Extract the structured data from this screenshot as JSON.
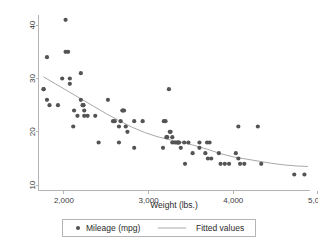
{
  "chart_data": {
    "type": "scatter",
    "title": "",
    "xlabel": "Weight (lbs.)",
    "ylabel": "",
    "xlim": [
      1700,
      4900
    ],
    "ylim": [
      9,
      42
    ],
    "grid": false,
    "legend_position": "bottom",
    "xticks": [
      2000,
      3000,
      4000,
      5000
    ],
    "xtick_labels": [
      "2,000",
      "3,000",
      "4,000",
      "5,000"
    ],
    "yticks": [
      10,
      20,
      30,
      40
    ],
    "ytick_labels": [
      "10",
      "20",
      "30",
      "40"
    ],
    "marker_color": "#545454",
    "line_color": "#a8a8a8",
    "axis_color": "#b4b4b4",
    "series": [
      {
        "name": "Mileage (mpg)",
        "type": "scatter",
        "marker": "filled-circle",
        "points": [
          [
            1760,
            28
          ],
          [
            1760,
            28
          ],
          [
            1800,
            34
          ],
          [
            1800,
            26
          ],
          [
            1830,
            25
          ],
          [
            1930,
            25
          ],
          [
            1980,
            30
          ],
          [
            2020,
            41
          ],
          [
            2020,
            35
          ],
          [
            2050,
            35
          ],
          [
            2070,
            29
          ],
          [
            2070,
            30
          ],
          [
            2110,
            21
          ],
          [
            2120,
            24
          ],
          [
            2160,
            23
          ],
          [
            2200,
            31
          ],
          [
            2200,
            26
          ],
          [
            2220,
            25
          ],
          [
            2230,
            25
          ],
          [
            2230,
            25
          ],
          [
            2240,
            24
          ],
          [
            2240,
            23
          ],
          [
            2280,
            23
          ],
          [
            2370,
            23
          ],
          [
            2410,
            18
          ],
          [
            2520,
            26
          ],
          [
            2580,
            22
          ],
          [
            2600,
            22
          ],
          [
            2650,
            18
          ],
          [
            2650,
            21
          ],
          [
            2670,
            22
          ],
          [
            2690,
            24
          ],
          [
            2700,
            24
          ],
          [
            2710,
            24
          ],
          [
            2730,
            21
          ],
          [
            2750,
            20
          ],
          [
            2830,
            17
          ],
          [
            2830,
            22
          ],
          [
            2930,
            22
          ],
          [
            3170,
            17
          ],
          [
            3180,
            22
          ],
          [
            3200,
            22
          ],
          [
            3210,
            19
          ],
          [
            3220,
            19
          ],
          [
            3240,
            28
          ],
          [
            3250,
            20
          ],
          [
            3260,
            20
          ],
          [
            3280,
            19
          ],
          [
            3280,
            18
          ],
          [
            3310,
            18
          ],
          [
            3330,
            18
          ],
          [
            3350,
            18
          ],
          [
            3350,
            18
          ],
          [
            3360,
            18
          ],
          [
            3380,
            17
          ],
          [
            3420,
            18
          ],
          [
            3430,
            14
          ],
          [
            3470,
            18
          ],
          [
            3520,
            16
          ],
          [
            3600,
            18
          ],
          [
            3600,
            17
          ],
          [
            3670,
            16
          ],
          [
            3690,
            18
          ],
          [
            3700,
            15
          ],
          [
            3720,
            18
          ],
          [
            3740,
            15
          ],
          [
            3830,
            16
          ],
          [
            3850,
            14
          ],
          [
            3900,
            14
          ],
          [
            3950,
            14
          ],
          [
            4030,
            16
          ],
          [
            4060,
            21
          ],
          [
            4060,
            15
          ],
          [
            4080,
            14
          ],
          [
            4130,
            14
          ],
          [
            4290,
            21
          ],
          [
            4330,
            14
          ],
          [
            4720,
            12
          ],
          [
            4840,
            12
          ]
        ]
      },
      {
        "name": "Fitted values",
        "type": "line",
        "points": [
          [
            1760,
            30.3
          ],
          [
            1900,
            29.0
          ],
          [
            2050,
            27.6
          ],
          [
            2200,
            26.2
          ],
          [
            2350,
            24.8
          ],
          [
            2500,
            23.4
          ],
          [
            2650,
            22.1
          ],
          [
            2800,
            20.9
          ],
          [
            2950,
            19.9
          ],
          [
            3100,
            19.1
          ],
          [
            3250,
            18.5
          ],
          [
            3400,
            18.0
          ],
          [
            3550,
            17.4
          ],
          [
            3700,
            16.7
          ],
          [
            3850,
            15.9
          ],
          [
            4000,
            15.3
          ],
          [
            4150,
            14.9
          ],
          [
            4300,
            14.5
          ],
          [
            4450,
            14.1
          ],
          [
            4600,
            13.8
          ],
          [
            4750,
            13.6
          ],
          [
            4880,
            13.5
          ]
        ]
      }
    ]
  },
  "legend": {
    "items": [
      {
        "label": "Mileage (mpg)",
        "marker": "dot"
      },
      {
        "label": "Fitted values",
        "marker": "line"
      }
    ]
  },
  "axes": {
    "x_title": "Weight (lbs.)"
  }
}
